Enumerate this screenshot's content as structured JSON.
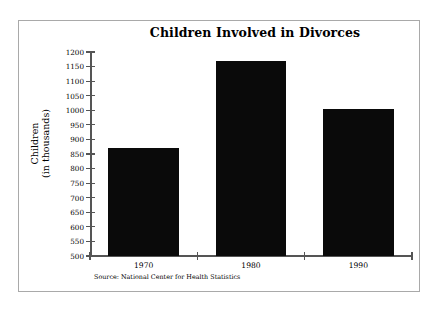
{
  "chart_data": {
    "type": "bar",
    "title": "Children Involved in Divorces",
    "categories": [
      "1970",
      "1980",
      "1990"
    ],
    "values": [
      870,
      1170,
      1005
    ],
    "xlabel": "",
    "ylabel": "Children\n(in thousands)",
    "ylabel_lines": [
      "Children",
      "(in thousands)"
    ],
    "ylim": [
      500,
      1200
    ],
    "ytick_interval": 50,
    "yticks": [
      1200,
      1150,
      1100,
      1050,
      1000,
      950,
      900,
      850,
      800,
      750,
      700,
      650,
      600,
      550,
      500
    ],
    "ytick_labels": [
      "1200",
      "1150",
      "1100",
      "1050",
      "1000",
      "950",
      "900",
      "850",
      "800",
      "750",
      "700",
      "650",
      "600",
      "550",
      "500"
    ],
    "grid": false,
    "legend": null,
    "bar_color": "#0a0a0a",
    "background_color": "#ffffff",
    "axis_color": "#555555",
    "source_note": "Source: National Center for Health Statistics"
  },
  "figure": {
    "border_color": "#a9a9a9"
  }
}
